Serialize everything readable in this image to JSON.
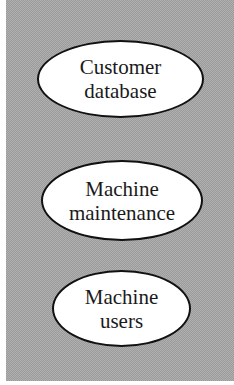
{
  "diagram": {
    "background": "#a9a9a9",
    "node_fill": "#ffffff",
    "node_border": "#111111",
    "nodes": [
      {
        "lines": [
          "Customer",
          "database"
        ]
      },
      {
        "lines": [
          "Machine",
          "maintenance"
        ]
      },
      {
        "lines": [
          "Machine",
          "users"
        ]
      }
    ]
  }
}
